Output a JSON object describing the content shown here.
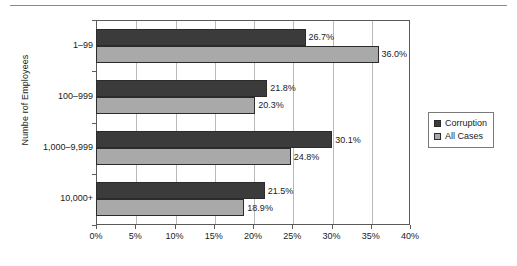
{
  "chart_data": {
    "type": "bar",
    "orientation": "horizontal",
    "title": "",
    "xlabel": "",
    "ylabel": "Numbe rof Employees",
    "categories": [
      "1–99",
      "100–999",
      "1,000–9,999",
      "10,000+"
    ],
    "series": [
      {
        "name": "Corruption",
        "color": "#3b3b3b",
        "values": [
          26.7,
          21.8,
          30.1,
          21.5
        ],
        "labels": [
          "26.7%",
          "21.8%",
          "30.1%",
          "21.5%"
        ]
      },
      {
        "name": "All Cases",
        "color": "#a9a9a9",
        "values": [
          36.0,
          20.3,
          24.8,
          18.9
        ],
        "labels": [
          "36.0%",
          "20.3%",
          "24.8%",
          "18.9%"
        ]
      }
    ],
    "xlim": [
      0,
      40
    ],
    "xticks": [
      0,
      5,
      10,
      15,
      20,
      25,
      30,
      35,
      40
    ],
    "xtick_labels": [
      "0%",
      "5%",
      "10%",
      "15%",
      "20%",
      "25%",
      "30%",
      "35%",
      "40%"
    ],
    "grid": "vertical",
    "legend_position": "right",
    "legend_entries": [
      "Corruption",
      "All Cases"
    ]
  }
}
